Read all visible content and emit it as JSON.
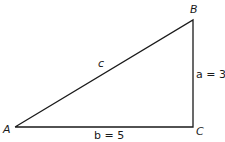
{
  "diagram": {
    "type": "right-triangle",
    "vertices": {
      "A": {
        "label": "A"
      },
      "B": {
        "label": "B"
      },
      "C": {
        "label": "C"
      }
    },
    "sides": {
      "a": {
        "label": "a = 3"
      },
      "b": {
        "label": "b = 5"
      },
      "c": {
        "label": "c"
      }
    },
    "colors": {
      "stroke": "#1a1a1a",
      "background": "#ffffff"
    }
  }
}
